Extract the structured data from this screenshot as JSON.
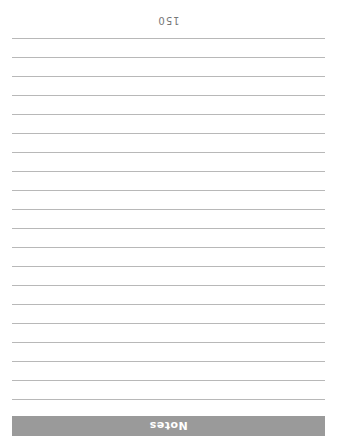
{
  "page": {
    "orientation": "rotated-180",
    "header_banner": {
      "label": "Notes",
      "background_color": "#9a9a9a",
      "text_color": "#ffffff"
    },
    "ruled_lines": {
      "count": 20,
      "color": "#b8b8b8"
    },
    "page_number": "150"
  }
}
